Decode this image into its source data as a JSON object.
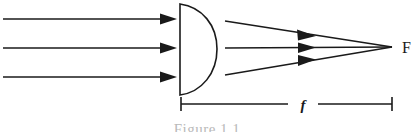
{
  "figure": {
    "caption": "Figure 1.1",
    "background_color": "#ffffff",
    "ink_color": "#1a1a1a"
  },
  "labels": {
    "focal_point": "F",
    "focal_length": "f"
  },
  "lens": {
    "name": "plano-convex-lens",
    "flat_edge_x": 180,
    "top_y": 4,
    "bottom_y": 95,
    "apex_x": 217,
    "apex_y": 49
  },
  "incoming_rays": {
    "count": 3,
    "start_x": 3,
    "end_x": 176,
    "y_positions": [
      19,
      48,
      77
    ],
    "direction": "rightward",
    "description": "parallel incident rays"
  },
  "refracted_rays": {
    "count": 3,
    "start_x": 225,
    "focus_x": 392,
    "focus_y": 47,
    "start_y_positions": [
      21,
      48,
      75
    ],
    "arrowhead_positions": [
      {
        "x": 312,
        "y": 33
      },
      {
        "x": 312,
        "y": 48
      },
      {
        "x": 312,
        "y": 62
      }
    ],
    "description": "rays converging to focal point"
  },
  "dimension": {
    "name": "focal-length-dimension",
    "y": 104,
    "left_tick_x": 181,
    "right_tick_x": 392,
    "tick_half_height": 7,
    "label_gap_start": 290,
    "label_gap_end": 316
  }
}
